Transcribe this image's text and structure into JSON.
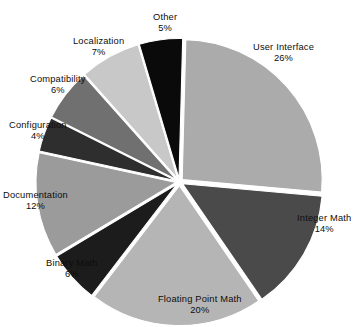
{
  "chart_data": {
    "type": "pie",
    "title": "",
    "subtitle": "",
    "xlabel": "",
    "ylabel": "",
    "legend_position": "none",
    "grid": false,
    "labels_outside": true,
    "exploded": true,
    "background_color": "#ffffff",
    "categories": [
      "User Interface",
      "Integer Math",
      "Floating Point Math",
      "Binary Math",
      "Documentation",
      "Configuration",
      "Compatibility",
      "Localization",
      "Other"
    ],
    "values": [
      26,
      14,
      20,
      6,
      12,
      4,
      6,
      7,
      5
    ],
    "value_labels": [
      "26%",
      "14%",
      "20%",
      "6%",
      "12%",
      "4%",
      "6%",
      "7%",
      "5%"
    ],
    "colors": [
      "#ababab",
      "#4a4a4a",
      "#b5b5b5",
      "#1c1c1c",
      "#9b9b9b",
      "#2e2e2e",
      "#707070",
      "#c8c8c8",
      "#0a0a0a"
    ],
    "slices": [
      {
        "label": "User Interface",
        "percent": 26,
        "percent_text": "26%",
        "color": "#ababab"
      },
      {
        "label": "Integer Math",
        "percent": 14,
        "percent_text": "14%",
        "color": "#4a4a4a"
      },
      {
        "label": "Floating Point Math",
        "percent": 20,
        "percent_text": "20%",
        "color": "#b5b5b5"
      },
      {
        "label": "Binary Math",
        "percent": 6,
        "percent_text": "6%",
        "color": "#1c1c1c"
      },
      {
        "label": "Documentation",
        "percent": 12,
        "percent_text": "12%",
        "color": "#9b9b9b"
      },
      {
        "label": "Configuration",
        "percent": 4,
        "percent_text": "4%",
        "color": "#2e2e2e"
      },
      {
        "label": "Compatibility",
        "percent": 6,
        "percent_text": "6%",
        "color": "#707070"
      },
      {
        "label": "Localization",
        "percent": 7,
        "percent_text": "7%",
        "color": "#c8c8c8"
      },
      {
        "label": "Other",
        "percent": 5,
        "percent_text": "5%",
        "color": "#0a0a0a"
      }
    ],
    "total_percent": 100
  }
}
